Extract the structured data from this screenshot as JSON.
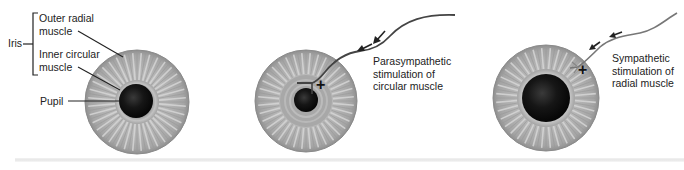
{
  "diagram": {
    "title": "",
    "panels": [
      {
        "id": "resting",
        "labels": {
          "iris": "Iris",
          "outer_radial": [
            "Outer radial",
            "muscle"
          ],
          "inner_circular": [
            "Inner circular",
            "muscle"
          ],
          "pupil": "Pupil"
        },
        "eye": {
          "cx": 137,
          "cy": 102,
          "r": 52,
          "pupil_r": 17,
          "ring_r": 21
        }
      },
      {
        "id": "parasympathetic",
        "caption": [
          "Parasympathetic",
          "stimulation of",
          "circular muscle"
        ],
        "stimulus_sign": "+",
        "eye": {
          "cx": 306,
          "cy": 101,
          "r": 51,
          "pupil_r": 12,
          "ring_r": 26
        }
      },
      {
        "id": "sympathetic",
        "caption": [
          "Sympathetic",
          "stimulation of",
          "radial muscle"
        ],
        "stimulus_sign": "+",
        "eye": {
          "cx": 546,
          "cy": 98,
          "r": 53,
          "pupil_r": 24,
          "ring_r": 28
        }
      }
    ],
    "colors": {
      "iris_base": "#a9a9a9",
      "iris_light": "#d4d4d4",
      "iris_edge": "#8e8e8e",
      "ring": "#b5b5b5",
      "pupil": "#111111",
      "nerve": "#444444",
      "text": "#222222"
    }
  }
}
